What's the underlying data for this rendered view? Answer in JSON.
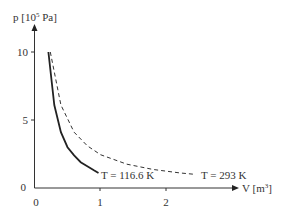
{
  "chart_data": {
    "type": "line",
    "title": "",
    "xlabel": "V [m³]",
    "ylabel": "p [10⁵ Pa]",
    "x_ticks": [
      "0",
      "1",
      "2"
    ],
    "y_ticks": [
      "0",
      "5",
      "10"
    ],
    "xlim": [
      0,
      3
    ],
    "ylim": [
      0,
      11.5
    ],
    "grid": false,
    "legend": "inline labels at curve ends",
    "series": [
      {
        "name": "T = 116.6 K",
        "style": "solid",
        "x": [
          0.21,
          0.3,
          0.4,
          0.5,
          0.6,
          0.7,
          0.8,
          0.9,
          0.97
        ],
        "y": [
          10.0,
          6.1,
          4.1,
          3.0,
          2.4,
          1.9,
          1.6,
          1.3,
          1.1
        ]
      },
      {
        "name": "T = 293 K",
        "style": "dashed",
        "x": [
          0.24,
          0.4,
          0.6,
          0.8,
          1.0,
          1.4,
          1.8,
          2.2,
          2.44
        ],
        "y": [
          10.0,
          6.1,
          4.1,
          3.1,
          2.45,
          1.75,
          1.36,
          1.11,
          1.0
        ]
      }
    ],
    "annotations": [
      "T = 116.6 K",
      "T = 293 K"
    ]
  },
  "labels": {
    "ylabel_p": "p [10",
    "ylabel_exp": "5",
    "ylabel_unit": " Pa]",
    "xlabel_v": "V [m",
    "xlabel_exp": "3",
    "xlabel_close": "]",
    "y0": "0",
    "y5": "5",
    "y10": "10",
    "x0": "0",
    "x1": "1",
    "x2": "2",
    "solid_label": "T = 116.6 K",
    "dashed_label": "T = 293 K"
  }
}
